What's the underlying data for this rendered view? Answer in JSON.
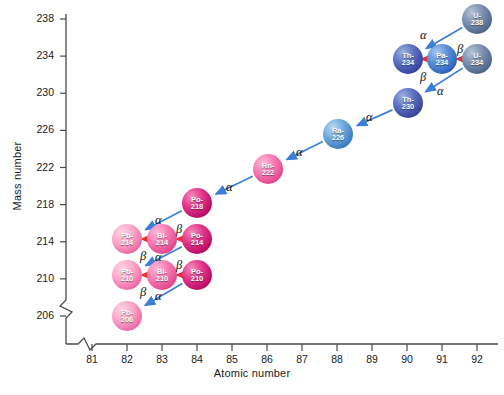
{
  "axes": {
    "x_title": "Atomic number",
    "y_title": "Mass number",
    "x_ticks": [
      "81",
      "82",
      "83",
      "84",
      "85",
      "86",
      "87",
      "88",
      "89",
      "90",
      "91",
      "92"
    ],
    "y_ticks": [
      "238",
      "234",
      "230",
      "226",
      "222",
      "218",
      "214",
      "210",
      "206"
    ]
  },
  "chart_data": {
    "type": "scatter",
    "xlabel": "Atomic number",
    "ylabel": "Mass number",
    "xlim": [
      80.5,
      92.5
    ],
    "ylim": [
      204,
      239
    ],
    "grid": false,
    "legend": "none",
    "nodes": [
      {
        "id": "U-238",
        "symbol": "U-",
        "mass": "238",
        "z": 92,
        "a": 238,
        "color": "blue-s",
        "px": 477,
        "py": 19
      },
      {
        "id": "Th-234",
        "symbol": "Th-",
        "mass": "234",
        "z": 90,
        "a": 234,
        "color": "blue-d",
        "px": 408,
        "py": 59
      },
      {
        "id": "Pa-234",
        "symbol": "Pa-",
        "mass": "234",
        "z": 91,
        "a": 234,
        "color": "blue-m",
        "px": 442,
        "py": 59
      },
      {
        "id": "U-234",
        "symbol": "U-",
        "mass": "234",
        "z": 92,
        "a": 234,
        "color": "blue-s",
        "px": 477,
        "py": 59
      },
      {
        "id": "Th-230",
        "symbol": "Th-",
        "mass": "230",
        "z": 90,
        "a": 230,
        "color": "blue-d",
        "px": 408,
        "py": 103
      },
      {
        "id": "Ra-226",
        "symbol": "Ra-",
        "mass": "226",
        "z": 88,
        "a": 226,
        "color": "blue-l",
        "px": 338,
        "py": 134
      },
      {
        "id": "Rn-222",
        "symbol": "Rn-",
        "mass": "222",
        "z": 86,
        "a": 222,
        "color": "pink-m",
        "px": 268,
        "py": 169
      },
      {
        "id": "Po-218",
        "symbol": "Po-",
        "mass": "218",
        "z": 84,
        "a": 218,
        "color": "pink-d",
        "px": 197,
        "py": 203
      },
      {
        "id": "Pb-214",
        "symbol": "Pb-",
        "mass": "214",
        "z": 82,
        "a": 214,
        "color": "pink-l",
        "px": 127,
        "py": 239
      },
      {
        "id": "Bi-214",
        "symbol": "Bi-",
        "mass": "214",
        "z": 83,
        "a": 214,
        "color": "pink-m",
        "px": 162,
        "py": 239
      },
      {
        "id": "Po-214",
        "symbol": "Po-",
        "mass": "214",
        "z": 84,
        "a": 214,
        "color": "pink-d",
        "px": 197,
        "py": 239
      },
      {
        "id": "Pb-210",
        "symbol": "Pb-",
        "mass": "210",
        "z": 82,
        "a": 210,
        "color": "pink-l",
        "px": 127,
        "py": 275
      },
      {
        "id": "Bi-210",
        "symbol": "Bi-",
        "mass": "210",
        "z": 83,
        "a": 210,
        "color": "pink-m",
        "px": 162,
        "py": 275
      },
      {
        "id": "Po-210",
        "symbol": "Po-",
        "mass": "210",
        "z": 84,
        "a": 210,
        "color": "pink-d",
        "px": 197,
        "py": 275
      },
      {
        "id": "Pb-206",
        "symbol": "Pb-",
        "mass": "206",
        "z": 82,
        "a": 206,
        "color": "pink-l",
        "px": 127,
        "py": 316
      }
    ],
    "decays": [
      {
        "from": "U-238",
        "to": "Th-234",
        "type": "alpha",
        "label": "α",
        "lx": 420,
        "ly": 28
      },
      {
        "from": "Th-234",
        "to": "Pa-234",
        "type": "beta",
        "label": "β",
        "lx": 420,
        "ly": 70
      },
      {
        "from": "Pa-234",
        "to": "U-234",
        "type": "beta",
        "label": "β",
        "lx": 457,
        "ly": 42
      },
      {
        "from": "U-234",
        "to": "Th-230",
        "type": "alpha",
        "label": "α",
        "lx": 437,
        "ly": 84
      },
      {
        "from": "Th-230",
        "to": "Ra-226",
        "type": "alpha",
        "label": "α",
        "lx": 366,
        "ly": 110
      },
      {
        "from": "Ra-226",
        "to": "Rn-222",
        "type": "alpha",
        "label": "α",
        "lx": 296,
        "ly": 145
      },
      {
        "from": "Rn-222",
        "to": "Po-218",
        "type": "alpha",
        "label": "α",
        "lx": 226,
        "ly": 180
      },
      {
        "from": "Po-218",
        "to": "Pb-214",
        "type": "alpha",
        "label": "α",
        "lx": 155,
        "ly": 213
      },
      {
        "from": "Pb-214",
        "to": "Bi-214",
        "type": "beta",
        "label": "β",
        "lx": 140,
        "ly": 249
      },
      {
        "from": "Bi-214",
        "to": "Po-214",
        "type": "beta",
        "label": "β",
        "lx": 176,
        "ly": 222
      },
      {
        "from": "Po-214",
        "to": "Pb-210",
        "type": "alpha",
        "label": "α",
        "lx": 155,
        "ly": 250
      },
      {
        "from": "Pb-210",
        "to": "Bi-210",
        "type": "beta",
        "label": "β",
        "lx": 140,
        "ly": 285
      },
      {
        "from": "Bi-210",
        "to": "Po-210",
        "type": "beta",
        "label": "β",
        "lx": 176,
        "ly": 258
      },
      {
        "from": "Po-210",
        "to": "Pb-206",
        "type": "alpha",
        "label": "α",
        "lx": 155,
        "ly": 289
      }
    ],
    "colors": {
      "alpha_arrow": "#3a7fd5",
      "beta_arrow": "#e8312a",
      "axis": "#4a4a4a"
    }
  }
}
